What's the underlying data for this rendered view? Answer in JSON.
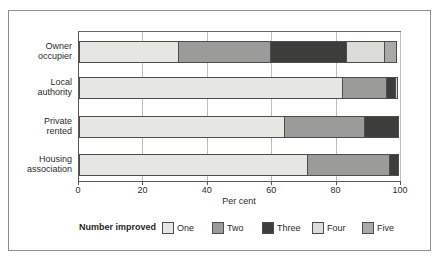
{
  "chart_data": {
    "type": "bar",
    "orientation": "horizontal-stacked",
    "title": "",
    "xlabel": "Per cent",
    "xlim": [
      0,
      100
    ],
    "xticks": [
      0,
      20,
      40,
      60,
      80,
      100
    ],
    "grid": "vertical",
    "legend_title": "Number improved",
    "legend_position": "bottom",
    "categories": [
      "Owner occupier",
      "Local authority",
      "Private rented",
      "Housing association"
    ],
    "category_lines": [
      [
        "Owner",
        "occupier"
      ],
      [
        "Local",
        "authority"
      ],
      [
        "Private",
        "rented"
      ],
      [
        "Housing",
        "association"
      ]
    ],
    "series": [
      {
        "name": "One",
        "color": "#e6e6e3",
        "values": [
          31,
          82,
          64,
          71
        ]
      },
      {
        "name": "Two",
        "color": "#9b9b99",
        "values": [
          29,
          14,
          25,
          26
        ]
      },
      {
        "name": "Three",
        "color": "#3d3d3b",
        "values": [
          24,
          3,
          11,
          3
        ]
      },
      {
        "name": "Four",
        "color": "#dcdcd9",
        "values": [
          12,
          1,
          0,
          0
        ]
      },
      {
        "name": "Five",
        "color": "#a9a9a6",
        "values": [
          4,
          0,
          0,
          0
        ]
      }
    ],
    "colors": {
      "bar_border": "#4d4d4d",
      "gridline": "#bdbdbd",
      "axis": "#565656",
      "frame_border": "#8f8f8f",
      "text": "#2b2b2b"
    }
  }
}
